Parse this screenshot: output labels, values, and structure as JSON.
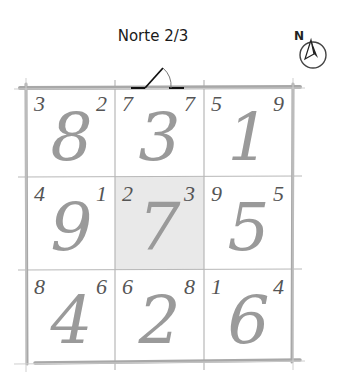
{
  "title": "Norte 2/3",
  "compass": {
    "label": "N",
    "icon": "north-arrow-icon"
  },
  "door": {
    "icon": "door-swing-icon",
    "position": "top-middle"
  },
  "colors": {
    "grid_line": "#aaaaaa",
    "big_number": "#9a9a9a",
    "small_number": "#555555",
    "center_fill": "#e9e9e9"
  },
  "grid": {
    "rows": [
      [
        {
          "main": "8",
          "left": "3",
          "right": "2"
        },
        {
          "main": "3",
          "left": "7",
          "right": "7"
        },
        {
          "main": "1",
          "left": "5",
          "right": "9"
        }
      ],
      [
        {
          "main": "9",
          "left": "4",
          "right": "1"
        },
        {
          "main": "7",
          "left": "2",
          "right": "3",
          "highlighted": true
        },
        {
          "main": "5",
          "left": "9",
          "right": "5"
        }
      ],
      [
        {
          "main": "4",
          "left": "8",
          "right": "6"
        },
        {
          "main": "2",
          "left": "6",
          "right": "8"
        },
        {
          "main": "6",
          "left": "1",
          "right": "4"
        }
      ]
    ]
  }
}
